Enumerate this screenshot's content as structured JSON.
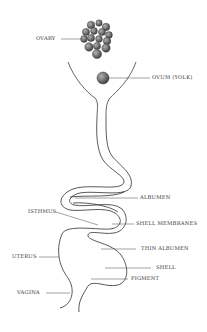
{
  "diagram": {
    "labels": {
      "ovary": "OVARY",
      "ovum": "OVUM (YOLK)",
      "albumen": "ALBUMEN",
      "isthmus": "ISTHMUS",
      "shell_membranes": "SHELL MEMBRANES",
      "thin_albumen": "THIN ALBUMEN",
      "uterus": "UTERUS",
      "shell": "SHELL",
      "pigment": "PIGMENT",
      "vagina": "VAGINA"
    },
    "colors": {
      "line": "#222222",
      "leader": "#444444",
      "follicle_fill": "#6e6e6e",
      "follicle_highlight": "#a8a8a8",
      "text": "#333333"
    }
  }
}
